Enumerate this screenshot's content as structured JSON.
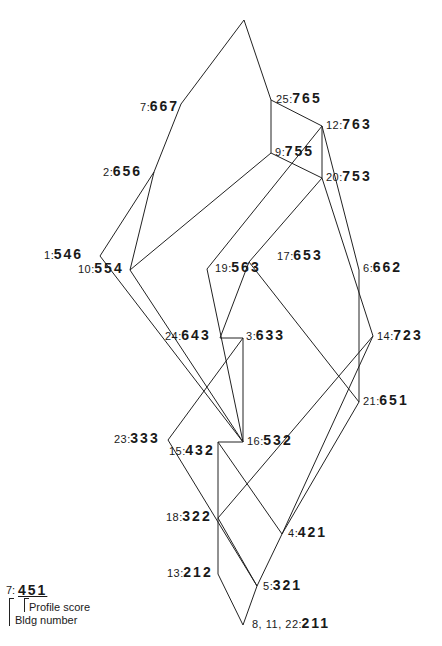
{
  "diagram": {
    "nodes": [
      {
        "id": "apex",
        "x": 244,
        "y": 20,
        "bldg": "",
        "score": ""
      },
      {
        "id": "n7",
        "x": 181,
        "y": 104,
        "bldg": "7",
        "score": "667",
        "lx": 140,
        "ly": 98
      },
      {
        "id": "n25",
        "x": 271,
        "y": 100,
        "bldg": "25",
        "score": "765",
        "lx": 276,
        "ly": 90
      },
      {
        "id": "n12",
        "x": 322,
        "y": 126,
        "bldg": "12",
        "score": "763",
        "lx": 326,
        "ly": 116
      },
      {
        "id": "n9",
        "x": 271,
        "y": 153,
        "bldg": "9",
        "score": "755",
        "lx": 275,
        "ly": 143
      },
      {
        "id": "n20",
        "x": 322,
        "y": 178,
        "bldg": "20",
        "score": "753",
        "lx": 326,
        "ly": 168
      },
      {
        "id": "n2",
        "x": 154,
        "y": 172,
        "bldg": "2",
        "score": "656",
        "lx": 103,
        "ly": 163
      },
      {
        "id": "n1",
        "x": 100,
        "y": 256,
        "bldg": "1",
        "score": "546",
        "lx": 44,
        "ly": 246
      },
      {
        "id": "n10",
        "x": 130,
        "y": 270,
        "bldg": "10",
        "score": "554",
        "lx": 78,
        "ly": 260
      },
      {
        "id": "n19",
        "x": 207,
        "y": 269,
        "bldg": "19",
        "score": "563",
        "lx": 215,
        "ly": 259
      },
      {
        "id": "n17",
        "x": 249,
        "y": 262,
        "bldg": "17",
        "score": "653",
        "lx": 277,
        "ly": 247
      },
      {
        "id": "n6",
        "x": 359,
        "y": 270,
        "bldg": "6",
        "score": "662",
        "lx": 363,
        "ly": 259
      },
      {
        "id": "n24",
        "x": 220,
        "y": 338,
        "bldg": "24",
        "score": "643",
        "lx": 165,
        "ly": 327
      },
      {
        "id": "n3",
        "x": 243,
        "y": 338,
        "bldg": "3",
        "score": "633",
        "lx": 246,
        "ly": 327
      },
      {
        "id": "n14",
        "x": 373,
        "y": 336,
        "bldg": "14",
        "score": "723",
        "lx": 377,
        "ly": 327
      },
      {
        "id": "n21",
        "x": 359,
        "y": 402,
        "bldg": "21",
        "score": "651",
        "lx": 363,
        "ly": 392
      },
      {
        "id": "n23",
        "x": 168,
        "y": 440,
        "bldg": "23",
        "score": "333",
        "lx": 114,
        "ly": 430
      },
      {
        "id": "n16",
        "x": 243,
        "y": 442,
        "bldg": "16",
        "score": "532",
        "lx": 247,
        "ly": 432
      },
      {
        "id": "n15",
        "x": 218,
        "y": 442,
        "bldg": "15",
        "score": "432",
        "lx": 169,
        "ly": 442
      },
      {
        "id": "n18",
        "x": 218,
        "y": 518,
        "bldg": "18",
        "score": "322",
        "lx": 166,
        "ly": 508
      },
      {
        "id": "n4",
        "x": 282,
        "y": 534,
        "bldg": "4",
        "score": "421",
        "lx": 288,
        "ly": 524
      },
      {
        "id": "n13",
        "x": 218,
        "y": 574,
        "bldg": "13",
        "score": "212",
        "lx": 167,
        "ly": 564
      },
      {
        "id": "n5",
        "x": 257,
        "y": 586,
        "bldg": "5",
        "score": "321",
        "lx": 263,
        "ly": 577
      },
      {
        "id": "n8_11_22",
        "x": 243,
        "y": 625,
        "bldg": "8, 11, 22",
        "score": "211",
        "lx": 252,
        "ly": 615
      }
    ],
    "edges": [
      [
        "apex",
        "n7"
      ],
      [
        "apex",
        "n25"
      ],
      [
        "n7",
        "n2"
      ],
      [
        "n25",
        "n12"
      ],
      [
        "n25",
        "n9"
      ],
      [
        "n12",
        "n20"
      ],
      [
        "n12",
        "n19"
      ],
      [
        "n12",
        "n6"
      ],
      [
        "n9",
        "n20"
      ],
      [
        "n9",
        "n10"
      ],
      [
        "n20",
        "n17"
      ],
      [
        "n20",
        "n14"
      ],
      [
        "n2",
        "n1"
      ],
      [
        "n2",
        "n10"
      ],
      [
        "n1",
        "n16"
      ],
      [
        "n10",
        "n16"
      ],
      [
        "n19",
        "n16"
      ],
      [
        "n17",
        "n24"
      ],
      [
        "n17",
        "n21"
      ],
      [
        "n6",
        "n21"
      ],
      [
        "n24",
        "n3"
      ],
      [
        "n3",
        "n16"
      ],
      [
        "n3",
        "n23"
      ],
      [
        "n14",
        "n18"
      ],
      [
        "n14",
        "n4"
      ],
      [
        "n21",
        "n4"
      ],
      [
        "n16",
        "n15"
      ],
      [
        "n23",
        "n5"
      ],
      [
        "n15",
        "n18"
      ],
      [
        "n15",
        "n4"
      ],
      [
        "n18",
        "n13"
      ],
      [
        "n18",
        "n5"
      ],
      [
        "n4",
        "n5"
      ],
      [
        "n13",
        "n8_11_22"
      ],
      [
        "n5",
        "n8_11_22"
      ]
    ]
  },
  "legend": {
    "example_bldg": "7:",
    "example_score": "451",
    "profile_label": "Profile score",
    "bldg_label": "Bldg number"
  }
}
